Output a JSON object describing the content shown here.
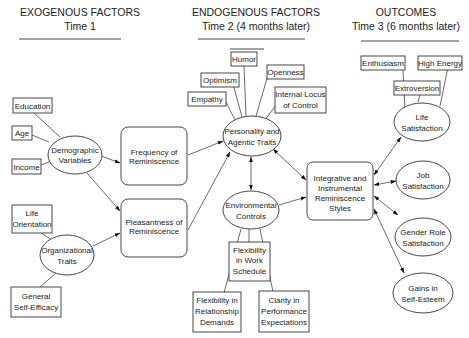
{
  "headers": {
    "exogenous": {
      "title": "EXOGENOUS FACTORS",
      "time": "Time  1"
    },
    "endogenous": {
      "title": "ENDOGENOUS FACTORS",
      "time": "Time 2  (4 months later)"
    },
    "outcomes": {
      "title": "OUTCOMES",
      "time": "Time 3  (6 months later)"
    }
  },
  "exogenous": {
    "education": "Education",
    "age": "Age",
    "income": "Income",
    "demographic": [
      "Demographic",
      "Variables"
    ],
    "life_orientation": [
      "Life",
      "Orientation"
    ],
    "self_efficacy": [
      "General",
      "Self-Efficacy"
    ],
    "organizational": [
      "Organizational",
      "Traits"
    ]
  },
  "reminiscence": {
    "frequency": [
      "Frequency  of",
      "Reminiscence"
    ],
    "pleasantness": [
      "Pleasantness of",
      "Reminiscence"
    ]
  },
  "endogenous": {
    "humor": "Humor",
    "optimism": "Optimism",
    "openness": "Openness",
    "empathy": "Empathy",
    "locus": [
      "Internal Locus",
      "of Control"
    ],
    "personality": [
      "Personality and",
      "Agentic Traits"
    ],
    "environmental": [
      "Environmental",
      "Controls"
    ],
    "work_schedule": [
      "Flexibility",
      "in Work",
      "Schedule"
    ],
    "relationship": [
      "Flexibility in",
      "Relationship",
      "Demands"
    ],
    "clarity": [
      "Clarity in",
      "Performance",
      "Expectations"
    ],
    "integrative": [
      "Integrative and",
      "Instrumental",
      "Reminiscence",
      "Styles"
    ]
  },
  "outcomes": {
    "enthusiasm": "Enthusiasm",
    "high_energy": "High Energy",
    "extroversion": "Extroversion",
    "life_satisfaction": [
      "Life",
      "Satisfaction"
    ],
    "job_satisfaction": [
      "Job",
      "Satisfaction"
    ],
    "gender_role": [
      "Gender Role",
      "Satisfaction"
    ],
    "self_esteem": [
      "Gains in",
      "Self-Esteem"
    ]
  }
}
